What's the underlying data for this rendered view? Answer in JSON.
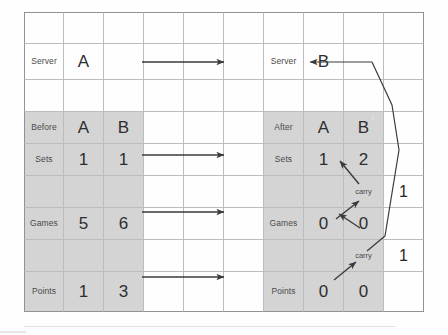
{
  "figure": {
    "kind": "tennis-scoreboard-carry-diagram",
    "grid": {
      "columns": 10,
      "rows": 9
    }
  },
  "server_row": {
    "before_label": "Server",
    "before_value": "A",
    "after_label": "Server",
    "after_value": "B"
  },
  "before_table": {
    "header_label": "Before",
    "header_a": "A",
    "header_b": "B",
    "rows": [
      {
        "label": "Sets",
        "a": "1",
        "b": "1"
      },
      {
        "label": "Games",
        "a": "5",
        "b": "6"
      },
      {
        "label": "Points",
        "a": "1",
        "b": "3"
      }
    ]
  },
  "after_table": {
    "header_label": "After",
    "header_a": "A",
    "header_b": "B",
    "rows": [
      {
        "label": "Sets",
        "a": "1",
        "b": "2"
      },
      {
        "label": "Games",
        "a": "0",
        "b": "0"
      },
      {
        "label": "Points",
        "a": "0",
        "b": "0"
      }
    ]
  },
  "carries": [
    {
      "label": "carry",
      "value": "1"
    },
    {
      "label": "carry",
      "value": "1"
    }
  ],
  "colors": {
    "shade": "#d4d4d4",
    "grid_line": "#b9bcc0",
    "grid_line_outer": "#8f9296",
    "ink": "#2e2e2e",
    "arrow": "#3a3a3a"
  },
  "chart_data": {
    "type": "table",
    "columns": [
      "",
      "A",
      "B"
    ],
    "before": {
      "Server": "A",
      "Sets": [
        "1",
        "1"
      ],
      "Games": [
        "5",
        "6"
      ],
      "Points": [
        "1",
        "3"
      ]
    },
    "after": {
      "Server": "B",
      "Sets": [
        "1",
        "2"
      ],
      "Games": [
        "0",
        "0"
      ],
      "Points": [
        "0",
        "0"
      ]
    },
    "annotations": [
      "carry 1 (points → games)",
      "carry 1 (games → sets)"
    ]
  }
}
